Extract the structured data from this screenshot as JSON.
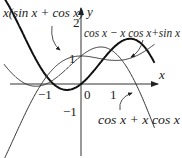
{
  "chart_data": {
    "type": "line",
    "title": "",
    "xlabel": "x",
    "ylabel": "y",
    "xlim": [
      -2.2,
      2.1
    ],
    "ylim": [
      -2.6,
      2.7
    ],
    "grid": false,
    "x_ticks": [
      "-1",
      "0",
      "1"
    ],
    "y_ticks": [
      "2",
      "1",
      "-1"
    ],
    "series": [
      {
        "name": "x(sin x + cos x)",
        "expr": "x*(Math.sin(x)+Math.cos(x))",
        "style": "thick",
        "domain": [
          -2.2,
          2.1
        ]
      },
      {
        "name": "cos x − x cos x+sin x",
        "expr": "Math.cos(x)-x*Math.cos(x)+Math.sin(x)",
        "style": "thin",
        "domain": [
          -2.2,
          2.1
        ]
      },
      {
        "name": "cos x + x cos x",
        "expr": "Math.cos(x)+x*Math.cos(x)",
        "style": "thin",
        "domain": [
          -2.2,
          2.1
        ]
      }
    ],
    "annotations": [
      {
        "text": "x(sin x + cos x)",
        "x": 3,
        "y": 20
      },
      {
        "text": "cos x − x cos x+sin x",
        "x": 84,
        "y": 37
      },
      {
        "text": "cos x + x cos x",
        "x": 98,
        "y": 124
      }
    ]
  },
  "labels": {
    "x_axis": "x",
    "y_axis": "y",
    "tick_neg1_x": "−1",
    "tick_0": "0",
    "tick_1_x": "1",
    "tick_2_y": "2",
    "tick_1_y": "1",
    "tick_neg1_y": "−1",
    "curve_a": "x(sin x + cos x)",
    "curve_b": "cos x − x cos x+sin x",
    "curve_c": "cos x + x cos x"
  }
}
